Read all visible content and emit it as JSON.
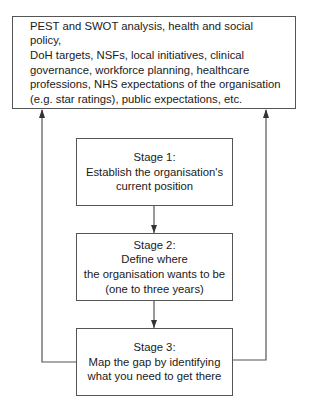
{
  "top_box": {
    "lines": [
      "PEST and SWOT analysis, health and social policy,",
      "DoH targets, NSFs, local initiatives, clinical",
      "governance, workforce planning, healthcare",
      "professions, NHS expectations of the organisation",
      "(e.g. star ratings), public expectations, etc."
    ]
  },
  "stages": [
    {
      "title": "Stage 1:",
      "lines": [
        "Establish the organisation's",
        "current position"
      ]
    },
    {
      "title": "Stage 2:",
      "lines": [
        "Define where",
        "the organisation wants to be",
        "(one to three years)"
      ]
    },
    {
      "title": "Stage 3:",
      "lines": [
        "Map the gap by identifying",
        "what you need to get there"
      ]
    }
  ],
  "colors": {
    "line": "#555555",
    "text": "#1a1a1a",
    "background": "#ffffff"
  }
}
